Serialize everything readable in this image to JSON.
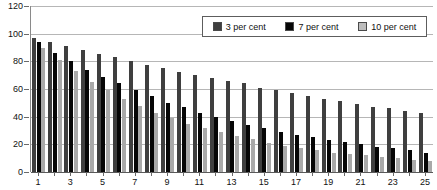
{
  "chart_data": {
    "type": "bar",
    "title": "the whole life costs",
    "xlabel": "",
    "ylabel": "",
    "ylim": [
      0,
      120
    ],
    "ytick_step": 20,
    "yticks": [
      0,
      20,
      40,
      60,
      80,
      100,
      120
    ],
    "grid": true,
    "legend_position": "top-right",
    "categories": [
      1,
      2,
      3,
      4,
      5,
      6,
      7,
      8,
      9,
      10,
      11,
      12,
      13,
      14,
      15,
      16,
      17,
      18,
      19,
      20,
      21,
      22,
      23,
      24,
      25
    ],
    "xtick_labels": [
      1,
      3,
      5,
      7,
      9,
      11,
      13,
      15,
      17,
      19,
      21,
      23,
      25
    ],
    "series": [
      {
        "name": "3 per cent",
        "color": "#3f3f3f",
        "values": [
          97,
          94,
          91,
          88,
          85,
          83,
          80,
          77,
          75,
          72,
          70,
          68,
          66,
          64,
          61,
          59,
          57,
          55,
          53,
          51,
          49,
          47,
          46,
          44,
          43
        ]
      },
      {
        "name": "7 per cent",
        "color": "#060606",
        "values": [
          94,
          86,
          80,
          74,
          69,
          64,
          59,
          55,
          50,
          47,
          43,
          40,
          37,
          34,
          32,
          29,
          27,
          25,
          23,
          22,
          20,
          18,
          17,
          16,
          14
        ]
      },
      {
        "name": "10 per cent",
        "color": "#a9a9a9",
        "values": [
          90,
          81,
          73,
          65,
          59,
          53,
          48,
          43,
          39,
          35,
          32,
          29,
          26,
          24,
          21,
          19,
          17,
          16,
          14,
          13,
          12,
          11,
          10,
          9,
          8
        ]
      }
    ]
  },
  "legend": {
    "entries": [
      {
        "label": "3 per cent"
      },
      {
        "label": "7 per cent"
      },
      {
        "label": "10 per cent"
      }
    ]
  }
}
